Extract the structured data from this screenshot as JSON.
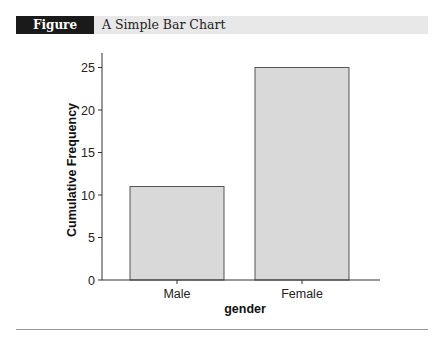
{
  "figure": {
    "label": "Figure A.16",
    "title": "A Simple Bar Chart"
  },
  "colors": {
    "bar_fill": "#d9d9d9",
    "bar_stroke": "#555555",
    "axis": "#333333",
    "header_bg": "#e8e8e8",
    "label_bg": "#1a1a1a"
  },
  "chart_data": {
    "type": "bar",
    "title": "A Simple Bar Chart",
    "categories": [
      "Male",
      "Female"
    ],
    "values": [
      11,
      25
    ],
    "xlabel": "gender",
    "ylabel": "Cumulative Frequency",
    "ylim": [
      0,
      26
    ],
    "yticks": [
      0,
      5,
      10,
      15,
      20,
      25
    ],
    "grid": false,
    "legend": null
  }
}
